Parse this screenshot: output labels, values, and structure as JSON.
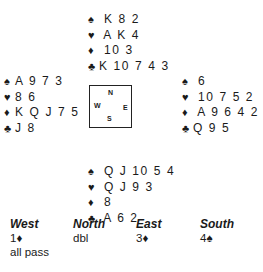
{
  "deal": {
    "north": {
      "spades": "K 8 2",
      "hearts": "A K 4",
      "diamonds": "10 3",
      "clubs": "K 10 7 4 3"
    },
    "west": {
      "spades": "A 9 7 3",
      "hearts": "8 6",
      "diamonds": "K Q J 7 5",
      "clubs": "J 8"
    },
    "east": {
      "spades": "6",
      "hearts": "10 7 5 2",
      "diamonds": "A 9 6 4 2",
      "clubs": "Q 9 5"
    },
    "south": {
      "spades": "Q J 10 5 4",
      "hearts": "Q J 9 3",
      "diamonds": "8",
      "clubs": "A 6 2"
    }
  },
  "symbols": {
    "spade": "♠",
    "heart": "♥",
    "diamond": "♦",
    "club": "♣"
  },
  "compass": {
    "n": "N",
    "w": "W",
    "e": "E",
    "s": "S"
  },
  "auction": {
    "headers": [
      "West",
      "North",
      "East",
      "South"
    ],
    "rows": [
      [
        "1♦",
        "dbl",
        "3♦",
        "4♠"
      ],
      [
        "all pass",
        "",
        "",
        ""
      ]
    ]
  }
}
